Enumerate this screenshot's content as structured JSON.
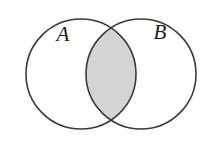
{
  "figure": {
    "kind": "venn-diagram",
    "title": "",
    "background_color": "#ffffff",
    "width": 213,
    "height": 151
  },
  "style": {
    "stroke_color": "#3a3a3a",
    "stroke_width": 1.6,
    "circle_fill": "#ffffff",
    "shaded_fill": "#d4d4d4",
    "label_color": "#1c1c1c",
    "label_font_size": 21
  },
  "sets": [
    {
      "id": "A",
      "label": "A",
      "label_x": 63,
      "label_y": 41,
      "center_x": 81,
      "center_y": 74,
      "radius": 55,
      "shaded": false
    },
    {
      "id": "B",
      "label": "B",
      "label_x": 160,
      "label_y": 39,
      "center_x": 141,
      "center_y": 74,
      "radius": 55,
      "shaded": false
    }
  ],
  "regions": [
    {
      "id": "A-only",
      "name": "A minus B",
      "shaded": false,
      "fill": "#ffffff"
    },
    {
      "id": "A-intersect-B",
      "name": "A intersection B",
      "shaded": true,
      "fill": "#d4d4d4"
    },
    {
      "id": "B-only",
      "name": "B minus A",
      "shaded": false,
      "fill": "#ffffff"
    }
  ],
  "intersection": {
    "shaded": true,
    "fill": "#d4d4d4",
    "top_crossing_x": 111,
    "top_crossing_y": 19,
    "bottom_crossing_x": 111,
    "bottom_crossing_y": 129,
    "left_extent_x": 86,
    "right_extent_x": 136
  }
}
